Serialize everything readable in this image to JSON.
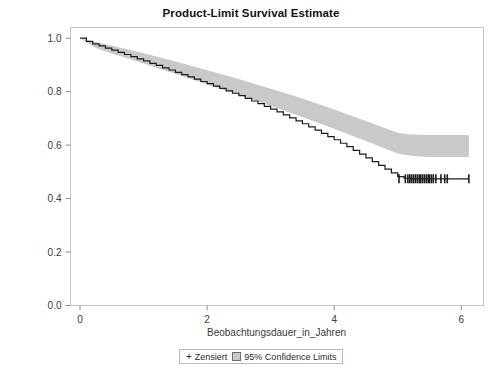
{
  "chart_data": {
    "type": "line",
    "title": "Product-Limit Survival Estimate",
    "xlabel": "Beobachtungsdauer_in_Jahren",
    "ylabel": "Überlebenswahrscheinlichkeit",
    "xlim": [
      -0.15,
      6.35
    ],
    "ylim": [
      0.0,
      1.04
    ],
    "grid": false,
    "legend_position": "bottom-center",
    "x_ticks": [
      0,
      2,
      4,
      6
    ],
    "x_tick_labels": [
      "0",
      "2",
      "4",
      "6"
    ],
    "y_ticks": [
      0.0,
      0.2,
      0.4,
      0.6,
      0.8,
      1.0
    ],
    "y_tick_labels": [
      "0.0",
      "0.2",
      "0.4",
      "0.6",
      "0.8",
      "1.0"
    ],
    "series": [
      {
        "name": "Survival estimate",
        "type": "step",
        "color": "#1c1c1c",
        "x": [
          0.0,
          0.1,
          0.2,
          0.3,
          0.4,
          0.5,
          0.6,
          0.7,
          0.8,
          0.9,
          1.0,
          1.1,
          1.2,
          1.3,
          1.4,
          1.5,
          1.6,
          1.7,
          1.8,
          1.9,
          2.0,
          2.1,
          2.2,
          2.3,
          2.4,
          2.5,
          2.6,
          2.7,
          2.8,
          2.9,
          3.0,
          3.1,
          3.2,
          3.3,
          3.4,
          3.5,
          3.6,
          3.7,
          3.8,
          3.9,
          4.0,
          4.1,
          4.2,
          4.3,
          4.4,
          4.5,
          4.6,
          4.7,
          4.8,
          4.9,
          5.0,
          5.1,
          5.2,
          5.4,
          5.6,
          5.8,
          6.0,
          6.12
        ],
        "y": [
          1.0,
          0.988,
          0.979,
          0.971,
          0.963,
          0.955,
          0.947,
          0.939,
          0.931,
          0.923,
          0.915,
          0.906,
          0.898,
          0.889,
          0.881,
          0.872,
          0.864,
          0.855,
          0.847,
          0.838,
          0.83,
          0.821,
          0.812,
          0.803,
          0.794,
          0.785,
          0.775,
          0.765,
          0.755,
          0.745,
          0.735,
          0.724,
          0.713,
          0.702,
          0.691,
          0.68,
          0.668,
          0.656,
          0.644,
          0.632,
          0.62,
          0.607,
          0.594,
          0.58,
          0.566,
          0.552,
          0.538,
          0.524,
          0.51,
          0.496,
          0.482,
          0.476,
          0.474,
          0.474,
          0.474,
          0.474,
          0.474,
          0.474
        ]
      }
    ],
    "confidence_band": {
      "name": "95% Confidence Limits",
      "level": "95%",
      "fill_color": "#c9c9c9",
      "x": [
        0.0,
        0.25,
        0.5,
        0.75,
        1.0,
        1.25,
        1.5,
        1.75,
        2.0,
        2.25,
        2.5,
        2.75,
        3.0,
        3.25,
        3.5,
        3.75,
        4.0,
        4.25,
        4.5,
        4.75,
        5.0,
        5.2,
        5.5,
        6.12
      ],
      "upper": [
        1.0,
        0.985,
        0.972,
        0.959,
        0.944,
        0.929,
        0.913,
        0.897,
        0.88,
        0.864,
        0.847,
        0.829,
        0.811,
        0.793,
        0.774,
        0.754,
        0.733,
        0.712,
        0.69,
        0.668,
        0.646,
        0.64,
        0.638,
        0.638
      ],
      "lower": [
        1.0,
        0.963,
        0.943,
        0.925,
        0.905,
        0.886,
        0.867,
        0.847,
        0.827,
        0.808,
        0.788,
        0.768,
        0.747,
        0.726,
        0.705,
        0.683,
        0.661,
        0.638,
        0.615,
        0.592,
        0.569,
        0.56,
        0.556,
        0.556
      ]
    },
    "censored_marks": {
      "name": "Zensiert",
      "symbol": "+",
      "color": "#1c1c1c",
      "y": 0.474,
      "x": [
        5.02,
        5.12,
        5.16,
        5.19,
        5.22,
        5.25,
        5.28,
        5.31,
        5.34,
        5.36,
        5.39,
        5.42,
        5.45,
        5.48,
        5.5,
        5.53,
        5.56,
        5.6,
        5.68,
        5.74,
        5.78,
        6.12
      ]
    }
  },
  "legend": {
    "censored_label": "Zensiert",
    "censored_symbol": "+",
    "confidence_label": "95% Confidence Limits"
  }
}
